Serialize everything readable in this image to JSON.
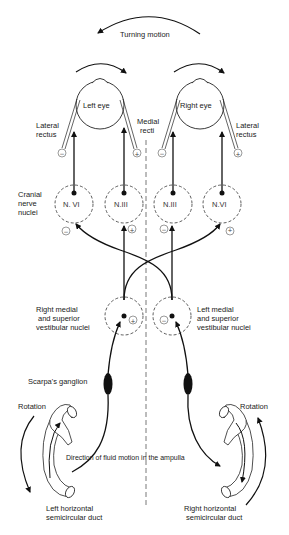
{
  "title": "Turning motion",
  "eyes": {
    "left": {
      "label": "Left eye"
    },
    "right": {
      "label": "Right eye"
    }
  },
  "muscles": {
    "left_lateral": "Lateral",
    "left_lateral_2": "rectus",
    "medial": "Medial",
    "medial_2": "recti",
    "right_lateral": "Lateral",
    "right_lateral_2": "rectus"
  },
  "cranial": {
    "label_1": "Cranial",
    "label_2": "nerve",
    "label_3": "nuclei",
    "nuclei": [
      {
        "name": "N. VI",
        "sign": "−"
      },
      {
        "name": "N.III",
        "sign": "+"
      },
      {
        "name": "N.III",
        "sign": "−"
      },
      {
        "name": "N.VI",
        "sign": "+"
      }
    ]
  },
  "vestibular": {
    "right": {
      "line1": "Right medial",
      "line2": "and superior",
      "line3": "vestibular nuclei",
      "sign": "+"
    },
    "left": {
      "line1": "Left medial",
      "line2": "and superior",
      "line3": "vestibular nuclei",
      "sign": "−"
    }
  },
  "ganglion": "Scarpa's ganglion",
  "rotation_left": "Rotation",
  "rotation_right": "Rotation",
  "fluid": "Direction of fluid motion in the ampulla",
  "ducts": {
    "left_1": "Left horizontal",
    "left_2": "semicircular duct",
    "right_1": "Right horizontal",
    "right_2": "semicircular duct"
  },
  "muscle_signs": {
    "left_lat": "−",
    "left_med": "+",
    "right_med": "−",
    "right_lat": "+"
  }
}
